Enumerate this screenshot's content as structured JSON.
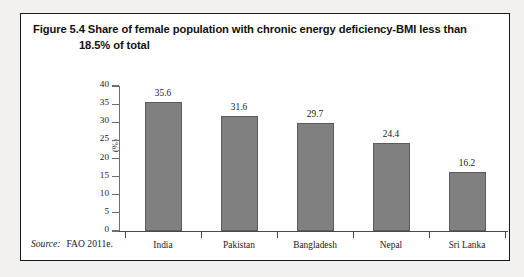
{
  "figure": {
    "title_line_1": "Figure 5.4 Share of female population with chronic energy deficiency-BMI less than",
    "title_line_2": "18.5% of total",
    "source_label": "Source:",
    "source_value": "FAO 2011e."
  },
  "chart_data": {
    "type": "bar",
    "title": "Figure 5.4 Share of female population with chronic energy deficiency-BMI less than 18.5% of total",
    "categories": [
      "India",
      "Pakistan",
      "Bangladesh",
      "Nepal",
      "Sri Lanka"
    ],
    "values": [
      35.6,
      31.6,
      29.7,
      24.4,
      16.2
    ],
    "value_labels": [
      "35.6",
      "31.6",
      "29.7",
      "24.4",
      "16.2"
    ],
    "xlabel": "",
    "ylabel": "(%)",
    "ylim": [
      0,
      40
    ],
    "ytick_labels": [
      "0",
      "5",
      "10",
      "15",
      "20",
      "25",
      "30",
      "35",
      "40"
    ],
    "ytick_values": [
      0,
      5,
      10,
      15,
      20,
      25,
      30,
      35,
      40
    ],
    "grid": false,
    "legend": false,
    "bar_color": "#808080",
    "bar_edge_color": "#5c5c5c",
    "axis_color": "#4a4a4a"
  }
}
